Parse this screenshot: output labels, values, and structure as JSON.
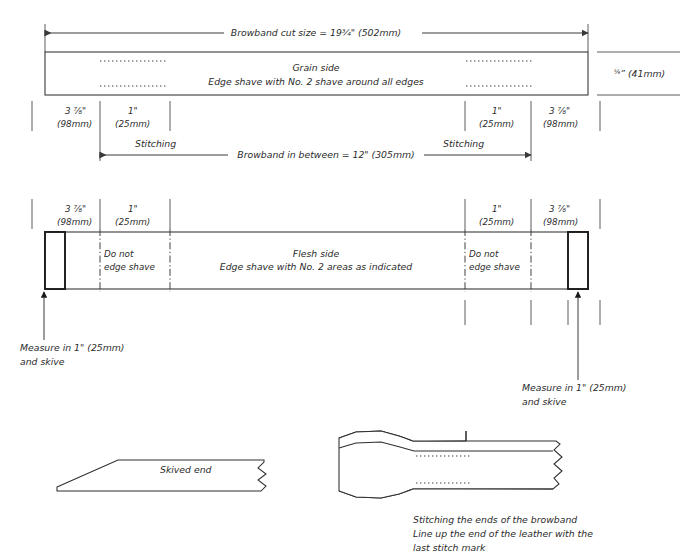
{
  "document": {
    "title": "Browband leather cutting and skiving diagram",
    "line_color": "#3a3a3a",
    "text_color": "#2b2b2b",
    "background": "#ffffff"
  },
  "grain_diagram": {
    "top_dimension": "Browband cut size = 19¾\" (502mm)",
    "panel_title": "Grain side",
    "panel_note": "Edge shave with No. 2 shave around all edges",
    "height_dimension": "⅝\" (41mm)",
    "segments": [
      {
        "inches": "3 ⅞\"",
        "mm": "(98mm)"
      },
      {
        "inches": "1\"",
        "mm": "(25mm)"
      },
      {
        "inches": "1\"",
        "mm": "(25mm)"
      },
      {
        "inches": "3 ⅞\"",
        "mm": "(98mm)"
      }
    ],
    "stitching_left": "Stitching",
    "stitching_right": "Stitching",
    "bottom_dimension": "Browband in between = 12\" (305mm)"
  },
  "flesh_diagram": {
    "panel_title": "Flesh side",
    "panel_note": "Edge shave with No. 2 areas as indicated",
    "no_shave_left_line1": "Do not",
    "no_shave_left_line2": "edge shave",
    "no_shave_right_line1": "Do not",
    "no_shave_right_line2": "edge shave",
    "segments": [
      {
        "inches": "3 ⅞\"",
        "mm": "(98mm)"
      },
      {
        "inches": "1\"",
        "mm": "(25mm)"
      },
      {
        "inches": "1\"",
        "mm": "(25mm)"
      },
      {
        "inches": "3 ⅞\"",
        "mm": "(98mm)"
      }
    ],
    "measure_left_line1": "Measure in 1\" (25mm)",
    "measure_left_line2": "and skive",
    "measure_right_line1": "Measure in 1\" (25mm)",
    "measure_right_line2": "and skive"
  },
  "skived_end_figure": {
    "label": "Skived end"
  },
  "stitching_figure": {
    "caption_line1": "Stitching the ends of the browband",
    "caption_line2": "Line up the end of the leather with the",
    "caption_line3": "last stitch mark"
  }
}
